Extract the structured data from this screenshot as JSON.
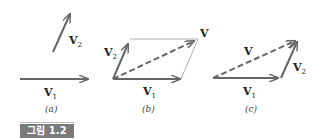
{
  "figure": {
    "caption": "그림 1.2",
    "panels": [
      {
        "id": "a",
        "label": "(a)",
        "vectors": [
          {
            "name": "V",
            "sub": "1"
          },
          {
            "name": "V",
            "sub": "2"
          }
        ]
      },
      {
        "id": "b",
        "label": "(b)",
        "vectors": [
          {
            "name": "V",
            "sub": "1"
          },
          {
            "name": "V",
            "sub": "2"
          },
          {
            "name": "V",
            "sub": ""
          }
        ]
      },
      {
        "id": "c",
        "label": "(c)",
        "vectors": [
          {
            "name": "V",
            "sub": "1"
          },
          {
            "name": "V",
            "sub": "2"
          },
          {
            "name": "V",
            "sub": ""
          }
        ]
      }
    ],
    "colors": {
      "vector": "#666666",
      "thin": "#999999",
      "badge": "#7a7a7a"
    }
  }
}
